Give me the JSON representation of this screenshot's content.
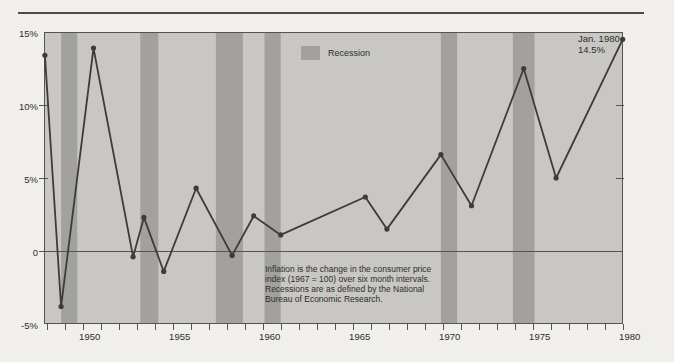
{
  "chart_data": {
    "type": "line",
    "title": "",
    "xlabel": "",
    "ylabel": "",
    "ylim": [
      -5,
      15
    ],
    "xlim": [
      1947.9,
      1980.0
    ],
    "grid": "zero-line only",
    "yticks": [
      {
        "value": 15,
        "label": "15%"
      },
      {
        "value": 10,
        "label": "10%"
      },
      {
        "value": 5,
        "label": "5%"
      },
      {
        "value": 0,
        "label": "0"
      },
      {
        "value": -5,
        "label": "-5%"
      }
    ],
    "xticks_labeled": [
      1950,
      1955,
      1960,
      1965,
      1970,
      1975,
      1980
    ],
    "xtick_minor_interval_years": 1,
    "series": [
      {
        "name": "Inflation",
        "points": [
          [
            1947.9,
            13.4
          ],
          [
            1948.8,
            -3.8
          ],
          [
            1950.6,
            13.9
          ],
          [
            1952.8,
            -0.4
          ],
          [
            1953.4,
            2.3
          ],
          [
            1954.5,
            -1.4
          ],
          [
            1956.3,
            4.3
          ],
          [
            1958.3,
            -0.3
          ],
          [
            1959.5,
            2.4
          ],
          [
            1961.0,
            1.1
          ],
          [
            1965.7,
            3.7
          ],
          [
            1966.9,
            1.5
          ],
          [
            1969.9,
            6.6
          ],
          [
            1971.6,
            3.1
          ],
          [
            1974.5,
            12.5
          ],
          [
            1976.3,
            5.0
          ],
          [
            1980.0,
            14.5
          ]
        ]
      }
    ],
    "recessions": [
      [
        1948.8,
        1949.7
      ],
      [
        1953.2,
        1954.2
      ],
      [
        1957.4,
        1958.9
      ],
      [
        1960.1,
        1961.0
      ],
      [
        1969.9,
        1970.8
      ],
      [
        1973.9,
        1975.1
      ]
    ],
    "legend": {
      "label": "Recession",
      "position": "top-center"
    },
    "annotation": {
      "lines": [
        "Jan. 1980",
        "14.5%"
      ]
    },
    "note": {
      "lines": [
        "Inflation is the change in the consumer price",
        "index (1967 = 100) over six month intervals.",
        "Recessions are as defined by the National",
        "Bureau of Economic Research."
      ]
    },
    "colors": {
      "page_bg": "#f1efec",
      "plot_bg": "#c8c7c4",
      "recession_band": "#a2a19e",
      "line": "#3d3c3a",
      "frame": "#55544f",
      "text": "#2e2d2b",
      "top_rule": "#4c4b47"
    }
  }
}
